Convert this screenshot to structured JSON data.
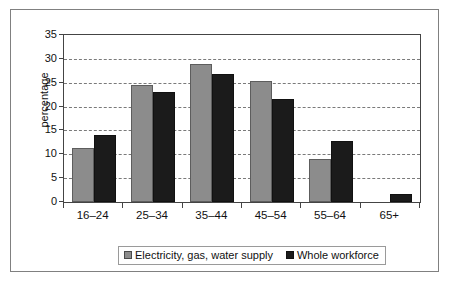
{
  "chart_data": {
    "type": "bar",
    "title": "",
    "xlabel": "",
    "ylabel": "percentage",
    "ylim": [
      0,
      35
    ],
    "ytick_step": 5,
    "yticks": [
      0,
      5,
      10,
      15,
      20,
      25,
      30,
      35
    ],
    "grid": true,
    "grid_axis": "y",
    "grid_style": "dashed",
    "legend_position": "bottom-center",
    "categories": [
      "16–24",
      "25–34",
      "35–44",
      "45–54",
      "55–64",
      "65+"
    ],
    "series": [
      {
        "name": "Electricity, gas, water supply",
        "color": "#8c8c8c",
        "values": [
          11.3,
          24.5,
          28.9,
          25.3,
          9.0,
          0
        ]
      },
      {
        "name": "Whole workforce",
        "color": "#1b1b1b",
        "values": [
          14.1,
          23.0,
          26.8,
          21.5,
          12.7,
          1.7
        ]
      }
    ]
  },
  "legend": {
    "items": [
      {
        "label": "Electricity, gas, water supply",
        "swatch": "grey-square-swatch"
      },
      {
        "label": "Whole workforce",
        "swatch": "black-square-swatch"
      }
    ]
  }
}
